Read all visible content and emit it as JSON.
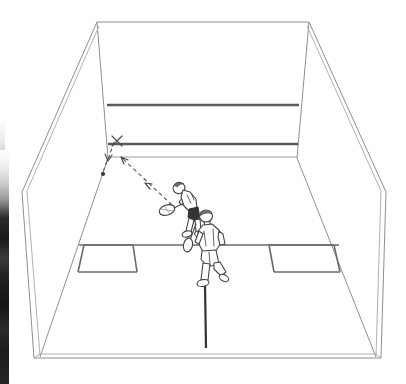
{
  "figure": {
    "background_color": "#ffffff",
    "line_color": "#888888",
    "bold_line_color": "#555555",
    "ink_color": "#444444"
  },
  "court": {
    "name": "squash-court",
    "front_wall": {
      "label": "front wall",
      "out_line": {
        "label": "front wall out line",
        "color": "#5a5a5a",
        "thickness": 2.4
      },
      "service_line": {
        "label": "service line",
        "color": "#5a5a5a",
        "thickness": 2.4
      },
      "tin_line": {
        "label": "tin / board top line",
        "color": "#9a9a9a",
        "thickness": 1
      }
    },
    "side_walls": {
      "left_label": "left side wall",
      "right_label": "right side wall",
      "out_line_label": "side wall out line"
    },
    "back_wall": {
      "label": "back wall"
    },
    "floor": {
      "short_line": {
        "label": "short line",
        "color": "#5a5a5a"
      },
      "half_court_line": {
        "label": "half court line",
        "color": "#333333"
      },
      "left_service_box": {
        "label": "left service box"
      },
      "right_service_box": {
        "label": "right service box"
      }
    }
  },
  "players": [
    {
      "id": "striker",
      "label": "rear player striking the ball",
      "shirt_color": "#ffffff",
      "shorts_color": "#333333",
      "skin_color": "#ffffff",
      "holds": "racket"
    },
    {
      "id": "opponent",
      "label": "front player moving to the T",
      "shirt_color": "#ffffff",
      "shorts_color": "#ffffff",
      "skin_color": "#ffffff",
      "holds": "racket"
    }
  ],
  "annotations": {
    "impact_mark": {
      "label": "X",
      "meaning": "ball contact point on front wall"
    },
    "ball": {
      "label": "ball",
      "meaning": "ball position after rebound"
    },
    "incoming_path": {
      "label": "shot path to front wall",
      "style": "dashed-arrow"
    },
    "outgoing_path": {
      "label": "rebound path down the side wall",
      "style": "dashed-arrow"
    }
  }
}
